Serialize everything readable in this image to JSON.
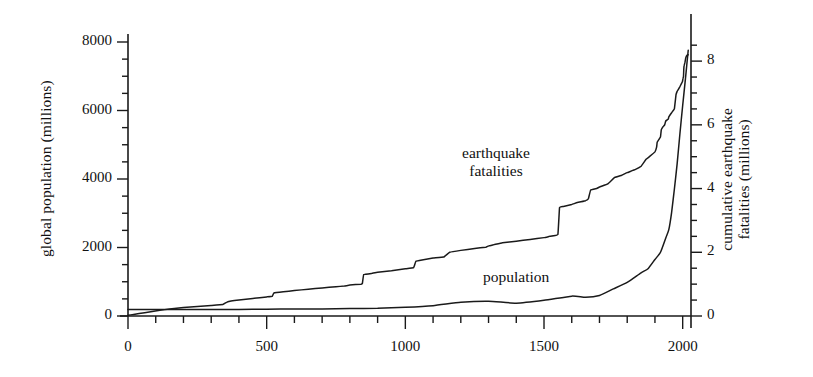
{
  "figure": {
    "name": "global-population-and-cumulative-earthquake-fatalities"
  },
  "axes": {
    "left": {
      "title": "global population (millions)",
      "ticks": [
        "0",
        "2000",
        "4000",
        "6000",
        "8000"
      ],
      "min": 0,
      "max": 8000,
      "minor_step": 500
    },
    "right": {
      "title_line1": "cumulative earthquake",
      "title_line2": "fatalities (millions)",
      "ticks": [
        "0",
        "2",
        "4",
        "6",
        "8"
      ],
      "min": 0,
      "max": 8.6,
      "minor_step": 0.5
    },
    "bottom": {
      "title": "",
      "ticks": [
        "0",
        "500",
        "1000",
        "1500",
        "2000"
      ],
      "min": 0,
      "max": 2030,
      "minor_step": 100
    }
  },
  "annotations": {
    "earthquake_line1": "earthquake",
    "earthquake_line2": "fatalities",
    "population": "population"
  },
  "colors": {
    "ink": "#1a1a1a",
    "background": "#ffffff"
  },
  "chart_data": {
    "type": "line",
    "title": "",
    "subtitle": "",
    "xlabel": "",
    "ylabel": "global population (millions)",
    "y2label": "cumulative earthquake fatalities (millions)",
    "xlim": [
      0,
      2030
    ],
    "ylim": [
      0,
      8000
    ],
    "y2lim": [
      0,
      8.6
    ],
    "grid": false,
    "legend": "inline-annotations",
    "xticks": [
      0,
      500,
      1000,
      1500,
      2000
    ],
    "yticks": [
      0,
      2000,
      4000,
      6000,
      8000
    ],
    "y2ticks": [
      0,
      2,
      4,
      6,
      8
    ],
    "series": [
      {
        "name": "population",
        "axis": "left",
        "units": "millions",
        "label_x": 1290,
        "label_y": 900,
        "x": [
          0,
          100,
          200,
          300,
          400,
          500,
          600,
          700,
          800,
          900,
          1000,
          1100,
          1200,
          1300,
          1400,
          1500,
          1600,
          1650,
          1700,
          1750,
          1800,
          1850,
          1875,
          1900,
          1920,
          1940,
          1950,
          1960,
          1970,
          1980,
          1990,
          2000,
          2010,
          2015,
          2020
        ],
        "y": [
          190,
          190,
          190,
          190,
          190,
          200,
          206,
          207,
          220,
          226,
          254,
          301,
          400,
          432,
          374,
          458,
          580,
          545,
          600,
          790,
          980,
          1260,
          1380,
          1650,
          1860,
          2300,
          2520,
          3020,
          3700,
          4440,
          5320,
          6145,
          6930,
          7350,
          7760
        ]
      },
      {
        "name": "earthquake fatalities",
        "axis": "right",
        "units": "millions",
        "label_x": 1055,
        "label_y": 4.55,
        "x": [
          0,
          20,
          60,
          115,
          150,
          200,
          250,
          300,
          342,
          360,
          400,
          450,
          500,
          520,
          526,
          560,
          600,
          650,
          700,
          750,
          780,
          800,
          840,
          845,
          850,
          880,
          900,
          950,
          1000,
          1030,
          1038,
          1060,
          1100,
          1138,
          1160,
          1200,
          1250,
          1290,
          1300,
          1320,
          1350,
          1400,
          1450,
          1500,
          1520,
          1550,
          1556,
          1570,
          1600,
          1620,
          1650,
          1660,
          1668,
          1690,
          1700,
          1730,
          1755,
          1780,
          1800,
          1830,
          1850,
          1868,
          1880,
          1900,
          1906,
          1908,
          1915,
          1920,
          1923,
          1930,
          1935,
          1939,
          1948,
          1950,
          1960,
          1970,
          1976,
          1980,
          1985,
          1990,
          1999,
          2001,
          2003,
          2004,
          2005,
          2008,
          2010,
          2011,
          2015,
          2020
        ],
        "y": [
          0.02,
          0.05,
          0.1,
          0.18,
          0.22,
          0.27,
          0.3,
          0.33,
          0.36,
          0.45,
          0.5,
          0.55,
          0.6,
          0.62,
          0.72,
          0.76,
          0.8,
          0.84,
          0.88,
          0.92,
          0.94,
          0.97,
          1.0,
          1.02,
          1.3,
          1.34,
          1.37,
          1.42,
          1.48,
          1.52,
          1.72,
          1.76,
          1.82,
          1.85,
          2.0,
          2.06,
          2.12,
          2.16,
          2.2,
          2.24,
          2.3,
          2.35,
          2.4,
          2.46,
          2.5,
          2.56,
          3.4,
          3.44,
          3.5,
          3.56,
          3.62,
          3.68,
          3.95,
          4.0,
          4.05,
          4.15,
          4.35,
          4.42,
          4.5,
          4.6,
          4.7,
          4.92,
          5.0,
          5.15,
          5.3,
          5.45,
          5.55,
          5.62,
          5.85,
          5.95,
          6.0,
          6.12,
          6.18,
          6.25,
          6.38,
          6.5,
          6.95,
          7.05,
          7.12,
          7.2,
          7.35,
          7.45,
          7.52,
          7.75,
          7.85,
          7.95,
          8.05,
          8.1,
          8.18,
          8.2
        ]
      }
    ]
  }
}
